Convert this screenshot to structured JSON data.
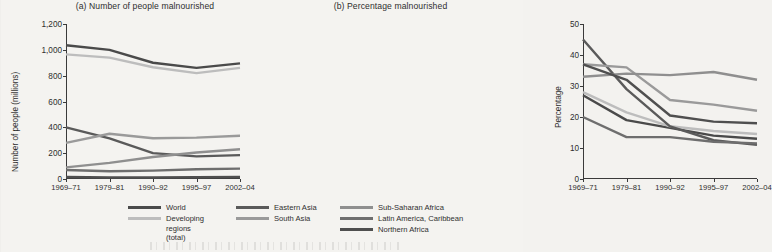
{
  "figure": {
    "background_color": "#f4f3f0"
  },
  "chart_data": [
    {
      "type": "line",
      "panel": "a",
      "title": "(a) Number of people malnourished",
      "xlabel": "",
      "ylabel": "Number of people (millions)",
      "categories": [
        "1969–71",
        "1979–81",
        "1990–92",
        "1995–97",
        "2002–04"
      ],
      "ylim": [
        0,
        1200
      ],
      "yticks": [
        0,
        200,
        400,
        600,
        800,
        1000,
        1200
      ],
      "ytick_labels": [
        "0",
        "200",
        "400",
        "600",
        "800",
        "1,000",
        "1,200"
      ],
      "grid": false,
      "legend_position": "below",
      "series": [
        {
          "name": "World",
          "color": "#4a4a4a",
          "values": [
            1035,
            1000,
            900,
            860,
            895
          ]
        },
        {
          "name": "Developing regions (total)",
          "color": "#bdbdbd",
          "values": [
            965,
            940,
            865,
            820,
            860
          ]
        },
        {
          "name": "Eastern Asia",
          "color": "#5a5a5a",
          "values": [
            400,
            315,
            200,
            175,
            185
          ]
        },
        {
          "name": "South Asia",
          "color": "#9a9a9a",
          "values": [
            280,
            350,
            315,
            320,
            335
          ]
        },
        {
          "name": "Sub-Saharan Africa",
          "color": "#8f8f8f",
          "values": [
            90,
            125,
            170,
            205,
            230
          ]
        },
        {
          "name": "Latin America, Caribbean",
          "color": "#6e6e6e",
          "values": [
            70,
            60,
            65,
            75,
            80
          ]
        },
        {
          "name": "Northern Africa",
          "color": "#4f4f4f",
          "values": [
            15,
            12,
            12,
            14,
            16
          ]
        }
      ]
    },
    {
      "type": "line",
      "panel": "b",
      "title": "(b) Percentage malnourished",
      "xlabel": "",
      "ylabel": "Percentage",
      "categories": [
        "1969–71",
        "1979–81",
        "1990–92",
        "1995–97",
        "2002–04"
      ],
      "ylim": [
        0,
        50
      ],
      "yticks": [
        0,
        10,
        20,
        30,
        40,
        50
      ],
      "ytick_labels": [
        "0",
        "10",
        "20",
        "30",
        "40",
        "50"
      ],
      "grid": false,
      "legend_position": "below",
      "series": [
        {
          "name": "World",
          "color": "#4a4a4a",
          "values": [
            27,
            19,
            16.5,
            14,
            13
          ]
        },
        {
          "name": "Developing regions (total)",
          "color": "#bdbdbd",
          "values": [
            28,
            21.5,
            17,
            15.5,
            14.5
          ]
        },
        {
          "name": "Eastern Asia",
          "color": "#5a5a5a",
          "values": [
            45,
            29,
            17,
            12.5,
            11
          ]
        },
        {
          "name": "South Asia",
          "color": "#9a9a9a",
          "values": [
            37,
            36,
            25.5,
            24,
            22
          ]
        },
        {
          "name": "Sub-Saharan Africa",
          "color": "#8f8f8f",
          "values": [
            33,
            34,
            33.5,
            34.5,
            32
          ]
        },
        {
          "name": "Latin America, Caribbean",
          "color": "#6e6e6e",
          "values": [
            20,
            13.5,
            13.5,
            12,
            11.5
          ]
        },
        {
          "name": "Northern Africa",
          "color": "#4f4f4f",
          "values": [
            37,
            32,
            20.5,
            18.5,
            18
          ]
        }
      ]
    }
  ],
  "legend": {
    "columns": [
      {
        "items": [
          {
            "label": "World",
            "color": "#4a4a4a",
            "wrap": false
          },
          {
            "label": "Developing regions (total)",
            "color": "#bdbdbd",
            "wrap": true
          }
        ]
      },
      {
        "items": [
          {
            "label": "Eastern Asia",
            "color": "#5a5a5a",
            "wrap": false
          },
          {
            "label": "South Asia",
            "color": "#9a9a9a",
            "wrap": false
          }
        ]
      },
      {
        "items": [
          {
            "label": "Sub-Saharan Africa",
            "color": "#8f8f8f",
            "wrap": false
          },
          {
            "label": "Latin America, Caribbean",
            "color": "#6e6e6e",
            "wrap": false
          },
          {
            "label": "Northern Africa",
            "color": "#4f4f4f",
            "wrap": false
          }
        ]
      }
    ]
  }
}
